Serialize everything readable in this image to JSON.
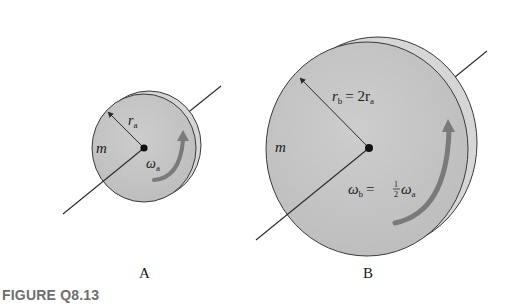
{
  "figure": {
    "caption": "FIGURE Q8.13",
    "colors": {
      "disk_face": "#c4c4c4",
      "disk_rim": "#d6d6d6",
      "outline": "#3a3a3a",
      "rotation_arrow": "#7a7a7a",
      "caption": "#6e6e6e"
    },
    "disks": [
      {
        "id": "A",
        "panel_label": "A",
        "mass_label": "m",
        "radius_symbol": "r",
        "radius_subscript": "a",
        "radius_expression": "",
        "omega_symbol": "ω",
        "omega_subscript": "a",
        "omega_expression": ""
      },
      {
        "id": "B",
        "panel_label": "B",
        "mass_label": "m",
        "radius_symbol": "r",
        "radius_subscript": "b",
        "radius_expression": "= 2r",
        "radius_expression_subscript": "a",
        "omega_symbol": "ω",
        "omega_subscript": "b",
        "omega_expression": "= ",
        "omega_fraction_num": "1",
        "omega_fraction_den": "2",
        "omega_tail": "ω",
        "omega_tail_subscript": "a"
      }
    ]
  }
}
